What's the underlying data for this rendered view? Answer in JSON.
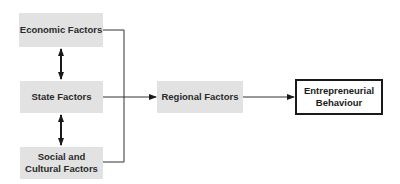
{
  "diagram": {
    "nodes": [
      {
        "id": "economic",
        "label": "Economic Factors"
      },
      {
        "id": "state",
        "label": "State Factors"
      },
      {
        "id": "social",
        "label_line1": "Social and",
        "label_line2": "Cultural Factors"
      },
      {
        "id": "regional",
        "label": "Regional Factors"
      },
      {
        "id": "entrepreneurial",
        "label_line1": "Entrepreneurial",
        "label_line2": "Behaviour"
      }
    ],
    "edges": [
      {
        "from": "economic",
        "to": "state",
        "type": "bidirectional"
      },
      {
        "from": "state",
        "to": "social",
        "type": "bidirectional"
      },
      {
        "from": "economic",
        "to": "regional",
        "type": "bracket-merge"
      },
      {
        "from": "state",
        "to": "regional",
        "type": "arrow"
      },
      {
        "from": "social",
        "to": "regional",
        "type": "bracket-merge"
      },
      {
        "from": "regional",
        "to": "entrepreneurial",
        "type": "arrow"
      }
    ],
    "colors": {
      "box_fill": "#e2e2e2",
      "line": "#333333",
      "outcome_border": "#1a1a1a"
    }
  }
}
